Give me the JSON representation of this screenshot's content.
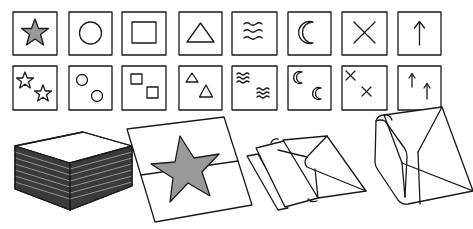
{
  "figure": {
    "title": "Symbol cards and folding steps",
    "colors": {
      "stroke": "#1a1a1a",
      "fill_gray": "#9a9a9a",
      "background": "#ffffff"
    }
  },
  "cards": {
    "single_row": [
      {
        "symbol": "star",
        "filled": true
      },
      {
        "symbol": "circle"
      },
      {
        "symbol": "square"
      },
      {
        "symbol": "triangle"
      },
      {
        "symbol": "waves"
      },
      {
        "symbol": "crescent-moon"
      },
      {
        "symbol": "cross"
      },
      {
        "symbol": "arrow-up"
      }
    ],
    "double_row": [
      {
        "symbol": "star",
        "count": 2
      },
      {
        "symbol": "circle",
        "count": 2
      },
      {
        "symbol": "square",
        "count": 2
      },
      {
        "symbol": "triangle",
        "count": 2
      },
      {
        "symbol": "waves",
        "count": 2
      },
      {
        "symbol": "crescent-moon",
        "count": 2
      },
      {
        "symbol": "cross",
        "count": 2
      },
      {
        "symbol": "arrow-up",
        "count": 2
      }
    ]
  },
  "steps": [
    {
      "name": "paper-stack"
    },
    {
      "name": "sheet-with-star"
    },
    {
      "name": "folded-sheet"
    },
    {
      "name": "folded-box"
    }
  ]
}
